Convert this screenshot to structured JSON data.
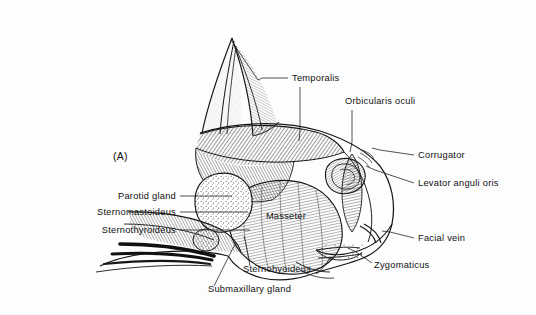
{
  "figure": {
    "panel_marker": "(A)",
    "background_color": "#fdfdfd",
    "ink_color": "#161616"
  },
  "labels": [
    {
      "id": "temporalis",
      "text": "Temporalis",
      "x": 292,
      "y": 81,
      "align": "start"
    },
    {
      "id": "orbicularis-oculi",
      "text": "Orbicularis oculi",
      "x": 345,
      "y": 104,
      "align": "start"
    },
    {
      "id": "corrugator",
      "text": "Corrugator",
      "x": 418,
      "y": 158,
      "align": "start"
    },
    {
      "id": "levator-anguli-oris",
      "text": "Levator anguli oris",
      "x": 418,
      "y": 186,
      "align": "start"
    },
    {
      "id": "facial-vein",
      "text": "Facial vein",
      "x": 418,
      "y": 241,
      "align": "start"
    },
    {
      "id": "zygomaticus",
      "text": "Zygomaticus",
      "x": 374,
      "y": 268,
      "align": "start"
    },
    {
      "id": "parotid-gland",
      "text": "Parotid gland",
      "x": 176,
      "y": 199,
      "align": "end"
    },
    {
      "id": "sternomastoideus",
      "text": "Sternomastoideus",
      "x": 176,
      "y": 215,
      "align": "end"
    },
    {
      "id": "sternothyroideus",
      "text": "Sternothyroideus",
      "x": 176,
      "y": 233,
      "align": "end"
    },
    {
      "id": "masseter",
      "text": "Masseter",
      "x": 286,
      "y": 219,
      "align": "middle"
    },
    {
      "id": "sternohyoideus",
      "text": "Sternohyoideus",
      "x": 243,
      "y": 272,
      "align": "start"
    },
    {
      "id": "submaxillary-gland",
      "text": "Submaxillary gland",
      "x": 208,
      "y": 292,
      "align": "start"
    }
  ],
  "leaders": [
    {
      "id": "leader-temporalis",
      "d": "M 288 78 L 262 78 L 258 80"
    },
    {
      "id": "leader-temporalis-stem",
      "d": "M 300 87 L 300 130 L 299 141"
    },
    {
      "id": "leader-orbicularis",
      "d": "M 352 110 L 352 142 L 350 152"
    },
    {
      "id": "leader-corrugator",
      "d": "M 414 155 L 380 150 L 372 148"
    },
    {
      "id": "leader-levator",
      "d": "M 414 183 L 375 170 L 366 166"
    },
    {
      "id": "leader-facial-vein",
      "d": "M 414 238 L 390 232 L 382 231"
    },
    {
      "id": "leader-zygomaticus",
      "d": "M 372 263 L 356 252 L 348 248"
    },
    {
      "id": "leader-parotid",
      "d": "M 180 196 L 232 196"
    },
    {
      "id": "leader-sternomastoideus",
      "d": "M 180 212 L 248 212"
    },
    {
      "id": "leader-sternothyroideus",
      "d": "M 180 230 L 250 230"
    },
    {
      "id": "leader-sternohyoideus",
      "d": "M 250 266 L 246 244 L 244 236"
    },
    {
      "id": "leader-submaxillary",
      "d": "M 214 286 L 232 250 L 236 243"
    },
    {
      "id": "leader-ear-top",
      "d": "M 258 80 L 231 40"
    }
  ]
}
